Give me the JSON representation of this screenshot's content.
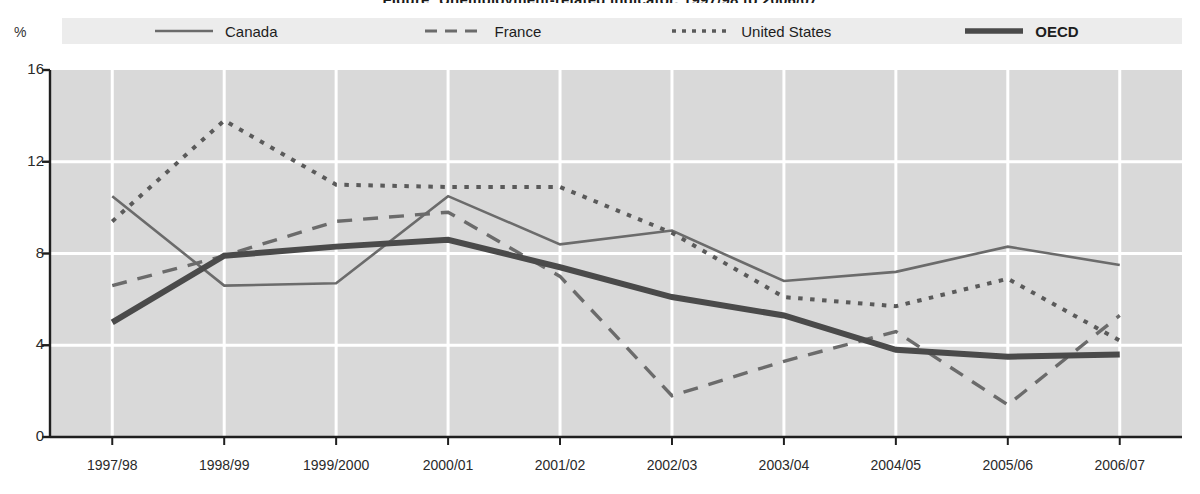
{
  "chart_data": {
    "type": "line",
    "title": "Figure: Unemployment-related indicator, 1997/98 to 2006/07",
    "subtitle": "",
    "xlabel": "",
    "ylabel": "%",
    "ylim": [
      0,
      16
    ],
    "yticks": [
      0,
      4,
      8,
      12,
      16
    ],
    "grid": true,
    "legend_position": "top",
    "categories": [
      "1997/98",
      "1998/99",
      "1999/2000",
      "2000/01",
      "2001/02",
      "2002/03",
      "2003/04",
      "2004/05",
      "2005/06",
      "2006/07"
    ],
    "series": [
      {
        "name": "Canada",
        "style": "solid-thin",
        "color": "#6b6b6b",
        "values": [
          10.5,
          6.6,
          6.7,
          10.5,
          8.4,
          9.0,
          6.8,
          7.2,
          8.3,
          7.5
        ]
      },
      {
        "name": "France",
        "style": "dashed",
        "color": "#6b6b6b",
        "values": [
          6.6,
          7.9,
          9.4,
          9.8,
          7.0,
          1.8,
          3.3,
          4.6,
          1.4,
          5.3
        ]
      },
      {
        "name": "United States",
        "style": "dotted",
        "color": "#5a5a5a",
        "values": [
          9.4,
          13.8,
          11.0,
          10.9,
          10.9,
          8.9,
          6.1,
          5.7,
          6.9,
          4.2
        ]
      },
      {
        "name": "OECD",
        "style": "solid-thick",
        "color": "#4a4a4a",
        "values": [
          5.0,
          7.9,
          8.3,
          8.6,
          7.4,
          6.1,
          5.3,
          3.8,
          3.5,
          3.6
        ]
      }
    ]
  },
  "axis": {
    "y_unit": "%",
    "y_tick_labels": [
      "16",
      "12",
      "8",
      "4",
      "0"
    ],
    "x_tick_labels": [
      "1997/98",
      "1998/99",
      "1999/2000",
      "2000/01",
      "2001/02",
      "2002/03",
      "2003/04",
      "2004/05",
      "2005/06",
      "2006/07"
    ]
  },
  "legend": {
    "items": [
      {
        "label": "Canada",
        "style": "solid-thin"
      },
      {
        "label": "France",
        "style": "dashed"
      },
      {
        "label": "United States",
        "style": "dotted"
      },
      {
        "label": "OECD",
        "style": "solid-thick"
      }
    ]
  },
  "colors": {
    "plot_background": "#d9d9d9",
    "legend_background": "#ececec",
    "gridline": "#ffffff",
    "axis": "#1f1f1f",
    "series_light": "#6b6b6b",
    "series_dark": "#4a4a4a"
  }
}
